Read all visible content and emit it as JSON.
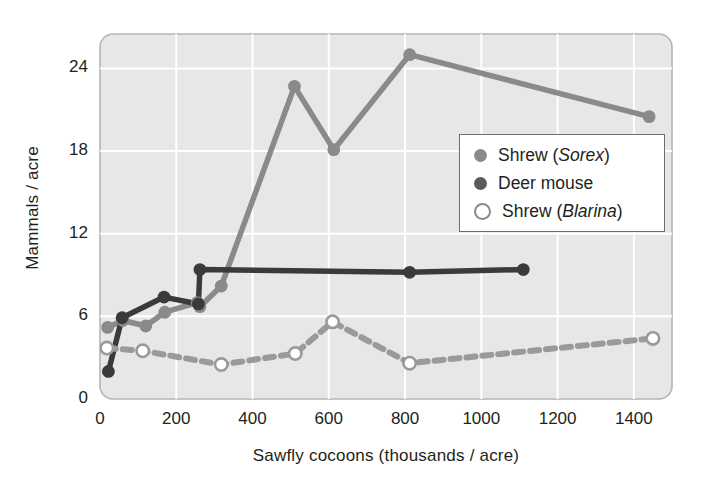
{
  "chart_data": {
    "type": "line",
    "title": "",
    "xlabel": "Sawfly cocoons (thousands / acre)",
    "ylabel": "Mammals / acre",
    "xlim": [
      0,
      1500
    ],
    "ylim": [
      0,
      26.5
    ],
    "xticks": [
      0,
      200,
      400,
      600,
      800,
      1000,
      1200,
      1400
    ],
    "yticks": [
      0,
      6,
      12,
      18,
      24
    ],
    "grid": true,
    "legend_position": "center-right",
    "series": [
      {
        "name": "Shrew (Sorex)",
        "name_plain": "Shrew (",
        "name_italic": "Sorex",
        "name_tail": ")",
        "color": "#8a8a8a",
        "marker": "filled-circle",
        "line_style": "solid",
        "points": [
          {
            "x": 20,
            "y": 5.2
          },
          {
            "x": 60,
            "y": 5.7
          },
          {
            "x": 120,
            "y": 5.3
          },
          {
            "x": 170,
            "y": 6.3
          },
          {
            "x": 255,
            "y": 7.0
          },
          {
            "x": 262,
            "y": 6.7
          },
          {
            "x": 318,
            "y": 8.2
          },
          {
            "x": 510,
            "y": 22.7
          },
          {
            "x": 613,
            "y": 18.1
          },
          {
            "x": 812,
            "y": 25.0
          },
          {
            "x": 1440,
            "y": 20.5
          }
        ]
      },
      {
        "name": "Deer mouse",
        "color": "#3a3a3a",
        "marker": "filled-circle",
        "line_style": "solid",
        "points": [
          {
            "x": 22,
            "y": 2.0
          },
          {
            "x": 58,
            "y": 5.9
          },
          {
            "x": 168,
            "y": 7.4
          },
          {
            "x": 258,
            "y": 6.9
          },
          {
            "x": 262,
            "y": 9.4
          },
          {
            "x": 812,
            "y": 9.2
          },
          {
            "x": 1110,
            "y": 9.4
          }
        ]
      },
      {
        "name": "Shrew (Blarina)",
        "name_plain": "Shrew (",
        "name_italic": "Blarina",
        "name_tail": ")",
        "color": "#9a9a9a",
        "marker": "open-circle",
        "line_style": "dashed",
        "points": [
          {
            "x": 18,
            "y": 3.7
          },
          {
            "x": 112,
            "y": 3.5
          },
          {
            "x": 318,
            "y": 2.5
          },
          {
            "x": 512,
            "y": 3.3
          },
          {
            "x": 610,
            "y": 5.6
          },
          {
            "x": 812,
            "y": 2.6
          },
          {
            "x": 1450,
            "y": 4.4
          }
        ]
      }
    ]
  },
  "legend": {
    "items": [
      {
        "label": "Shrew (Sorex)"
      },
      {
        "label": "Deer mouse"
      },
      {
        "label": "Shrew (Blarina)"
      }
    ]
  },
  "colors": {
    "plot_background": "#e7e7e7",
    "gridline": "#ffffff",
    "frame": "#b5b5b5",
    "sorex": "#8a8a8a",
    "deer_mouse": "#3a3a3a",
    "blarina": "#9a9a9a",
    "text": "#231f20"
  }
}
